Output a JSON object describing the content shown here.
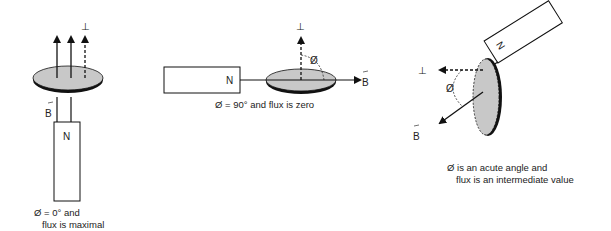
{
  "panels": [
    {
      "id": "maximal",
      "magnet_label": "N",
      "field_label": "B",
      "normal_label": "⊥",
      "caption_line1": "Ø = 0° and",
      "caption_line2": "flux is maximal"
    },
    {
      "id": "zero",
      "magnet_label": "N",
      "field_label": "B",
      "normal_label": "⊥",
      "angle_label": "Ø",
      "caption_line1": "Ø = 90° and flux is zero"
    },
    {
      "id": "intermediate",
      "magnet_label": "N",
      "field_label": "B",
      "normal_label": "⊥",
      "angle_label": "Ø",
      "caption_line1": "Ø is an acute angle and",
      "caption_line2": "flux is an intermediate value"
    }
  ],
  "colors": {
    "disc_fill": "#c8c8c8",
    "stroke": "#111111"
  }
}
